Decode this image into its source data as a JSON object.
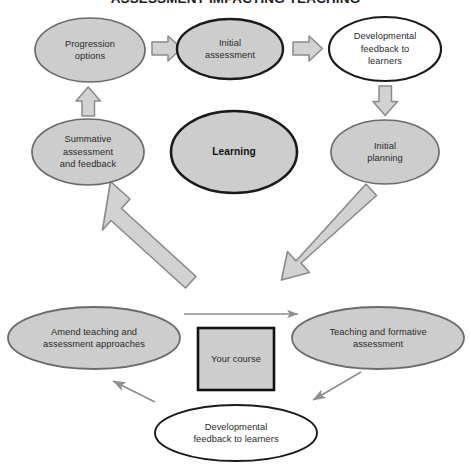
{
  "diagram": {
    "title": "ASSESSMENT IMPACTING TEACHING",
    "title_visible_fragment": "SSESSMENT IMPACTING TEACHING",
    "colors": {
      "shape_fill_grey": "#cdcdcd",
      "shape_fill_white": "#ffffff",
      "shape_stroke_grey": "#6b6b6b",
      "shape_stroke_dark": "#1a1a1a",
      "block_arrow_fill": "#d2d2d2",
      "block_arrow_stroke": "#8a8a8a",
      "thin_arrow": "#8e8e8e",
      "box_fill": "#cdcdcd",
      "box_stroke": "#111111",
      "text": "#2a2a2a",
      "background": "#ffffff"
    },
    "nodes": [
      {
        "id": "progression-options",
        "label": "Progression\noptions",
        "shape": "ellipse",
        "fill": "grey",
        "stroke": "grey"
      },
      {
        "id": "initial-assessment",
        "label": "Initial\nassessment",
        "shape": "ellipse",
        "fill": "grey",
        "stroke": "dark"
      },
      {
        "id": "developmental-feedback-top",
        "label": "Developmental\nfeedback to\nlearners",
        "shape": "ellipse",
        "fill": "white",
        "stroke": "dark"
      },
      {
        "id": "summative-assessment",
        "label": "Summative\nassessment\nand feedback",
        "shape": "ellipse",
        "fill": "grey",
        "stroke": "grey"
      },
      {
        "id": "learning",
        "label": "Learning",
        "shape": "ellipse",
        "fill": "grey",
        "stroke": "dark",
        "bold": true
      },
      {
        "id": "initial-planning",
        "label": "Initial\nplanning",
        "shape": "ellipse",
        "fill": "grey",
        "stroke": "grey"
      },
      {
        "id": "amend-teaching",
        "label": "Amend teaching and\nassessment approaches",
        "shape": "ellipse",
        "fill": "grey",
        "stroke": "grey"
      },
      {
        "id": "your-course",
        "label": "Your course",
        "shape": "rectangle",
        "fill": "grey",
        "stroke": "dark"
      },
      {
        "id": "teaching-formative",
        "label": "Teaching and formative\nassessment",
        "shape": "ellipse",
        "fill": "grey",
        "stroke": "grey"
      },
      {
        "id": "developmental-feedback-bottom",
        "label": "Developmental\nfeedback to learners",
        "shape": "ellipse",
        "fill": "white",
        "stroke": "dark"
      }
    ],
    "connectors": [
      {
        "id": "progression-to-initial-assessment",
        "style": "block-arrow",
        "direction": "right"
      },
      {
        "id": "initial-assessment-to-developmental-feedback",
        "style": "block-arrow",
        "direction": "right"
      },
      {
        "id": "developmental-feedback-to-initial-planning",
        "style": "block-arrow",
        "direction": "down"
      },
      {
        "id": "summative-to-progression",
        "style": "block-arrow",
        "direction": "up"
      },
      {
        "id": "amend-teaching-to-summative",
        "style": "block-arrow",
        "direction": "up-left"
      },
      {
        "id": "initial-planning-to-teaching",
        "style": "block-arrow",
        "direction": "down-right"
      },
      {
        "id": "amend-to-teaching-thin",
        "style": "thin-arrow",
        "direction": "right"
      },
      {
        "id": "teaching-to-developmental-feedback-thin",
        "style": "thin-arrow",
        "direction": "down-left"
      },
      {
        "id": "developmental-feedback-to-amend-thin",
        "style": "thin-arrow",
        "direction": "up-left"
      }
    ]
  }
}
